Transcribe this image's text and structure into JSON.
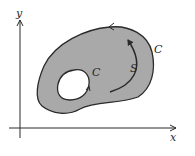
{
  "diagram": {
    "axes": {
      "x_label": "x",
      "y_label": "y"
    },
    "region": {
      "label": "S",
      "fill": "#a9a9a9"
    },
    "boundary": {
      "outer_label": "C",
      "inner_label": "C"
    },
    "colors": {
      "stroke": "#2a2a2a",
      "region_fill": "#a9a9a9",
      "hole_fill": "#ffffff",
      "background": "#ffffff"
    }
  }
}
